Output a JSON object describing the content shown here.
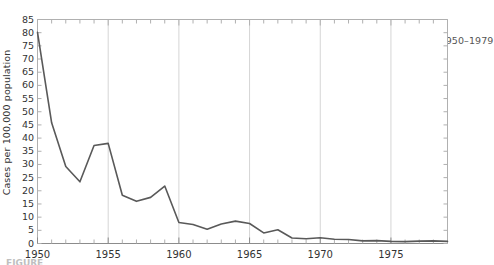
{
  "chart_data": {
    "type": "line",
    "title": "PERTUSSIS (Whooping cough) — Reported case rates by year, United States, 1950–1979",
    "title_parts": {
      "bold": "PERTUSSIS (Whooping cough)",
      "dash": " — ",
      "rest": "Reported case rates by year, United States, 1950–1979"
    },
    "xlabel": "",
    "ylabel": "Cases per 100,000 population",
    "xlim": [
      1950,
      1979
    ],
    "ylim": [
      0,
      85
    ],
    "grid": true,
    "grid_axis": "x",
    "legend": false,
    "line_color": "#595959",
    "x": [
      1950,
      1951,
      1952,
      1953,
      1954,
      1955,
      1956,
      1957,
      1958,
      1959,
      1960,
      1961,
      1962,
      1963,
      1964,
      1965,
      1966,
      1967,
      1968,
      1969,
      1970,
      1971,
      1972,
      1973,
      1974,
      1975,
      1976,
      1977,
      1978,
      1979
    ],
    "values": [
      80.1,
      45.8,
      29.2,
      23.4,
      37.2,
      38.0,
      18.3,
      16.0,
      17.5,
      21.8,
      8.0,
      7.2,
      5.4,
      7.4,
      8.5,
      7.6,
      4.0,
      5.2,
      2.1,
      1.8,
      2.2,
      1.6,
      1.5,
      1.0,
      1.1,
      0.8,
      0.7,
      0.9,
      1.0,
      0.8
    ],
    "y_ticks": [
      0,
      5,
      10,
      15,
      20,
      25,
      30,
      35,
      40,
      45,
      50,
      55,
      60,
      65,
      70,
      75,
      80,
      85
    ],
    "x_ticks_labeled": [
      1950,
      1955,
      1960,
      1965,
      1970,
      1975
    ],
    "x_minor_tick_interval": 1,
    "background_color": "#ffffff",
    "axis_color": "#b0b0b0",
    "gridline_color": "#d5d5d5",
    "tick_label_color": "#333333"
  },
  "caption": {
    "text": "FIGURE"
  }
}
